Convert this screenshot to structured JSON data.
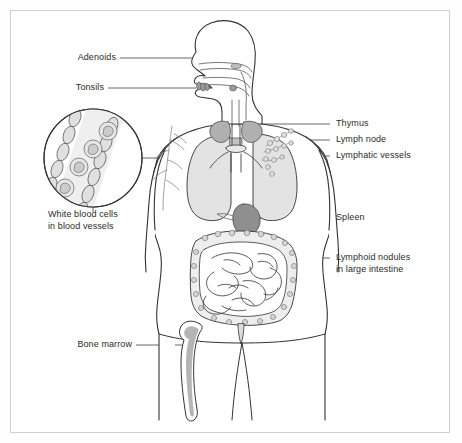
{
  "figure": {
    "border_color": "#cfcfcf",
    "background": "#ffffff",
    "text_color": "#2b2b2b",
    "outline_color": "#333333",
    "organ_fill_light": "#e3e3e3",
    "organ_fill_dark": "#9a9a9a",
    "leader_color": "#555555"
  },
  "labels": {
    "adenoids": "Adenoids",
    "tonsils": "Tonsils",
    "white_blood_cells_line1": "White blood cells",
    "white_blood_cells_line2": "in blood vessels",
    "bone_marrow": "Bone marrow",
    "thymus": "Thymus",
    "lymph_node": "Lymph node",
    "lymphatic_vessels": "Lymphatic vessels",
    "spleen": "Spleen",
    "lymphoid_nodules_line1": "Lymphoid nodules",
    "lymphoid_nodules_line2": "in large intestine"
  },
  "parts": [
    {
      "id": "adenoids",
      "name": "Adenoids",
      "side": "left"
    },
    {
      "id": "tonsils",
      "name": "Tonsils",
      "side": "left"
    },
    {
      "id": "white-blood-cells",
      "name": "White blood cells in blood vessels",
      "side": "left"
    },
    {
      "id": "bone-marrow",
      "name": "Bone marrow",
      "side": "left"
    },
    {
      "id": "thymus",
      "name": "Thymus",
      "side": "right"
    },
    {
      "id": "lymph-node",
      "name": "Lymph node",
      "side": "right"
    },
    {
      "id": "lymphatic-vessels",
      "name": "Lymphatic vessels",
      "side": "right"
    },
    {
      "id": "spleen",
      "name": "Spleen",
      "side": "right"
    },
    {
      "id": "lymphoid-nodules",
      "name": "Lymphoid nodules in large intestine",
      "side": "right"
    }
  ]
}
